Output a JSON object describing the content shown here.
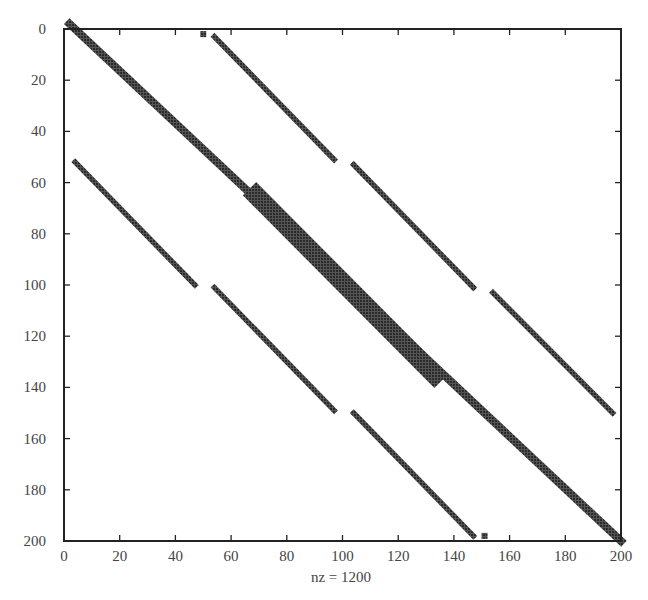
{
  "chart_data": {
    "type": "scatter",
    "subtype": "sparsity-pattern (spy plot)",
    "title": "",
    "xlabel": "nz = 1200",
    "ylabel": "",
    "xlim": [
      0,
      200
    ],
    "ylim": [
      200,
      0
    ],
    "x_ticks": [
      0,
      20,
      40,
      60,
      80,
      100,
      120,
      140,
      160,
      180,
      200
    ],
    "y_ticks": [
      0,
      20,
      40,
      60,
      80,
      100,
      120,
      140,
      160,
      180,
      200
    ],
    "grid": false,
    "legend": null,
    "marker_color": "#3a3a3a",
    "nz": 1200,
    "segments": [
      {
        "name": "main-diagonal",
        "from": [
          2,
          -2
        ],
        "to": [
          200,
          200
        ],
        "width": 3
      },
      {
        "name": "main-diagonal-thick-block",
        "from": [
          69,
          65
        ],
        "to": [
          133,
          135
        ],
        "width": 7
      },
      {
        "name": "upper-stripe-1",
        "from": [
          54,
          3
        ],
        "to": [
          97,
          51
        ],
        "width": 2
      },
      {
        "name": "upper-stripe-2",
        "from": [
          104,
          53
        ],
        "to": [
          147,
          101
        ],
        "width": 2
      },
      {
        "name": "upper-stripe-3",
        "from": [
          154,
          103
        ],
        "to": [
          197,
          150
        ],
        "width": 2
      },
      {
        "name": "lower-stripe-1",
        "from": [
          4,
          52
        ],
        "to": [
          47,
          100
        ],
        "width": 2
      },
      {
        "name": "lower-stripe-2",
        "from": [
          54,
          101
        ],
        "to": [
          97,
          149
        ],
        "width": 2
      },
      {
        "name": "lower-stripe-3",
        "from": [
          104,
          150
        ],
        "to": [
          147,
          198
        ],
        "width": 2
      }
    ],
    "isolated_blocks": [
      {
        "at": [
          50,
          2
        ]
      },
      {
        "at": [
          151,
          198
        ]
      }
    ]
  }
}
